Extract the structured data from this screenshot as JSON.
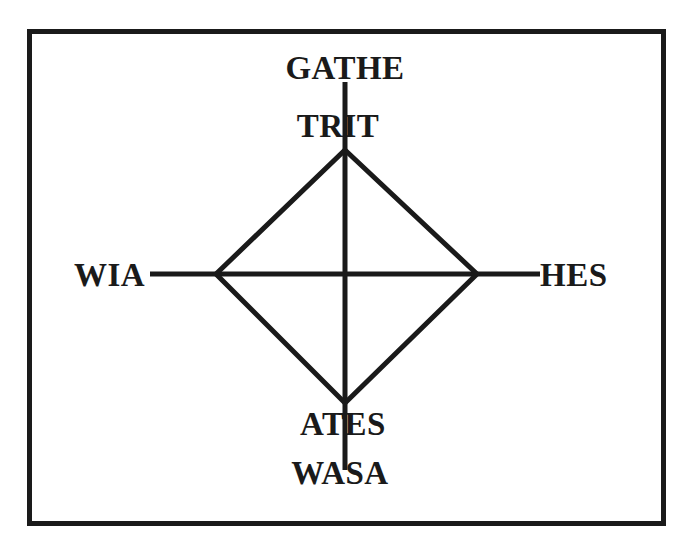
{
  "diagram": {
    "type": "cross-diamond",
    "labels": {
      "top_outer": "GATHE",
      "top_inner": "TRIT",
      "bottom_inner": "ATES",
      "bottom_outer": "WASA",
      "left": "WIA",
      "right": "HES"
    },
    "colors": {
      "stroke": "#1a1a1a",
      "background": "#ffffff"
    }
  }
}
